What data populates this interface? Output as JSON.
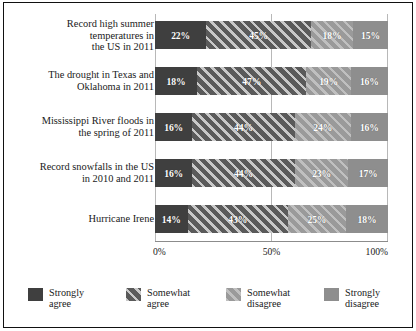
{
  "chart_data": {
    "type": "bar",
    "orientation": "horizontal",
    "stacked": true,
    "stacked_normalized": true,
    "title": "",
    "subtitle": "",
    "xlabel": "",
    "ylabel": "",
    "xlim": [
      0,
      100
    ],
    "xticks": [
      0,
      50,
      100
    ],
    "xtick_labels": [
      "0%",
      "50%",
      "100%"
    ],
    "grid": true,
    "grid_axis": "x",
    "legend_position": "bottom",
    "categories": [
      "Record high summer\ntemperatures in\nthe US in 2011",
      "The drought in Texas and\nOklahoma in 2011",
      "Mississippi River floods in\nthe spring of 2011",
      "Record snowfalls in the US\nin 2010 and 2011",
      "Hurricane Irene"
    ],
    "series": [
      {
        "name": "Strongly\nagree",
        "legend_label": "Strongly\nagree",
        "color": "#3f3f3f",
        "pattern": "solid",
        "values": [
          22,
          18,
          16,
          16,
          14
        ],
        "value_labels": [
          "22%",
          "18%",
          "16%",
          "16%",
          "14%"
        ]
      },
      {
        "name": "Somewhat\nagree",
        "legend_label": "Somewhat\nagree",
        "color": "#5a5a5a",
        "pattern": "diagonal-hatch",
        "values": [
          45,
          47,
          44,
          44,
          43
        ],
        "value_labels": [
          "45%",
          "47%",
          "44%",
          "44%",
          "43%"
        ]
      },
      {
        "name": "Somewhat\ndisagree",
        "legend_label": "Somewhat\ndisagree",
        "color": "#9a9a9a",
        "pattern": "diagonal-hatch-light",
        "values": [
          18,
          19,
          24,
          23,
          25
        ],
        "value_labels": [
          "18%",
          "19%",
          "24%",
          "23%",
          "25%"
        ]
      },
      {
        "name": "Strongly\ndisagree",
        "legend_label": "Strongly\ndisagree",
        "color": "#8e8e8e",
        "pattern": "solid",
        "values": [
          15,
          16,
          16,
          17,
          18
        ],
        "value_labels": [
          "15%",
          "16%",
          "16%",
          "17%",
          "18%"
        ]
      }
    ]
  },
  "axis": {
    "ticks": [
      {
        "label": "0%",
        "value": 0
      },
      {
        "label": "50%",
        "value": 50
      },
      {
        "label": "100%",
        "value": 100
      }
    ]
  },
  "rows": [
    {
      "label": "Record high summer\ntemperatures in\nthe US in 2011",
      "segments": [
        {
          "label": "22%",
          "value": 22
        },
        {
          "label": "45%",
          "value": 45
        },
        {
          "label": "18%",
          "value": 18
        },
        {
          "label": "15%",
          "value": 15
        }
      ]
    },
    {
      "label": "The drought in Texas and\nOklahoma in 2011",
      "segments": [
        {
          "label": "18%",
          "value": 18
        },
        {
          "label": "47%",
          "value": 47
        },
        {
          "label": "19%",
          "value": 19
        },
        {
          "label": "16%",
          "value": 16
        }
      ]
    },
    {
      "label": "Mississippi River floods in\nthe spring of 2011",
      "segments": [
        {
          "label": "16%",
          "value": 16
        },
        {
          "label": "44%",
          "value": 44
        },
        {
          "label": "24%",
          "value": 24
        },
        {
          "label": "16%",
          "value": 16
        }
      ]
    },
    {
      "label": "Record snowfalls in the US\nin 2010 and 2011",
      "segments": [
        {
          "label": "16%",
          "value": 16
        },
        {
          "label": "44%",
          "value": 44
        },
        {
          "label": "23%",
          "value": 23
        },
        {
          "label": "17%",
          "value": 17
        }
      ]
    },
    {
      "label": "Hurricane Irene",
      "segments": [
        {
          "label": "14%",
          "value": 14
        },
        {
          "label": "43%",
          "value": 43
        },
        {
          "label": "25%",
          "value": 25
        },
        {
          "label": "18%",
          "value": 18
        }
      ]
    }
  ],
  "legend": {
    "items": [
      {
        "label": "Strongly\nagree",
        "color": "#3f3f3f",
        "pattern": "solid"
      },
      {
        "label": "Somewhat\nagree",
        "color": "#5a5a5a",
        "pattern": "diagonal-hatch"
      },
      {
        "label": "Somewhat\ndisagree",
        "color": "#9a9a9a",
        "pattern": "diagonal-hatch-light"
      },
      {
        "label": "Strongly\ndisagree",
        "color": "#8e8e8e",
        "pattern": "solid"
      }
    ]
  }
}
